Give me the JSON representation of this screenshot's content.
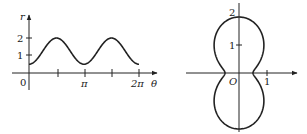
{
  "chart_data": [
    {
      "type": "line",
      "title": "",
      "xlabel": "θ",
      "ylabel": "r",
      "x_ticks": [
        "0",
        "π",
        "2π"
      ],
      "y_ticks": [
        "1",
        "2"
      ],
      "function": "r = 1.25 - 0.75 cos(2θ)",
      "x": [
        0,
        0.785,
        1.571,
        2.356,
        3.142,
        3.927,
        4.712,
        5.498,
        6.283
      ],
      "values": [
        0.5,
        1.25,
        2,
        1.25,
        0.5,
        1.25,
        2,
        1.25,
        0.5
      ],
      "ylim": [
        0,
        2.5
      ],
      "grid": false
    },
    {
      "type": "polar",
      "title": "",
      "origin_label": "O",
      "x_ticks": [
        "1"
      ],
      "y_ticks": [
        "1",
        "2"
      ],
      "function": "r = 1.25 - 0.75 cos(2θ)",
      "grid": false
    }
  ],
  "left": {
    "r_label": "r",
    "theta_label": "θ",
    "zero": "0",
    "pi": "π",
    "two_pi": "2π",
    "one": "1",
    "two": "2"
  },
  "right": {
    "origin": "O",
    "one_x": "1",
    "one_y": "1",
    "two_y": "2"
  }
}
